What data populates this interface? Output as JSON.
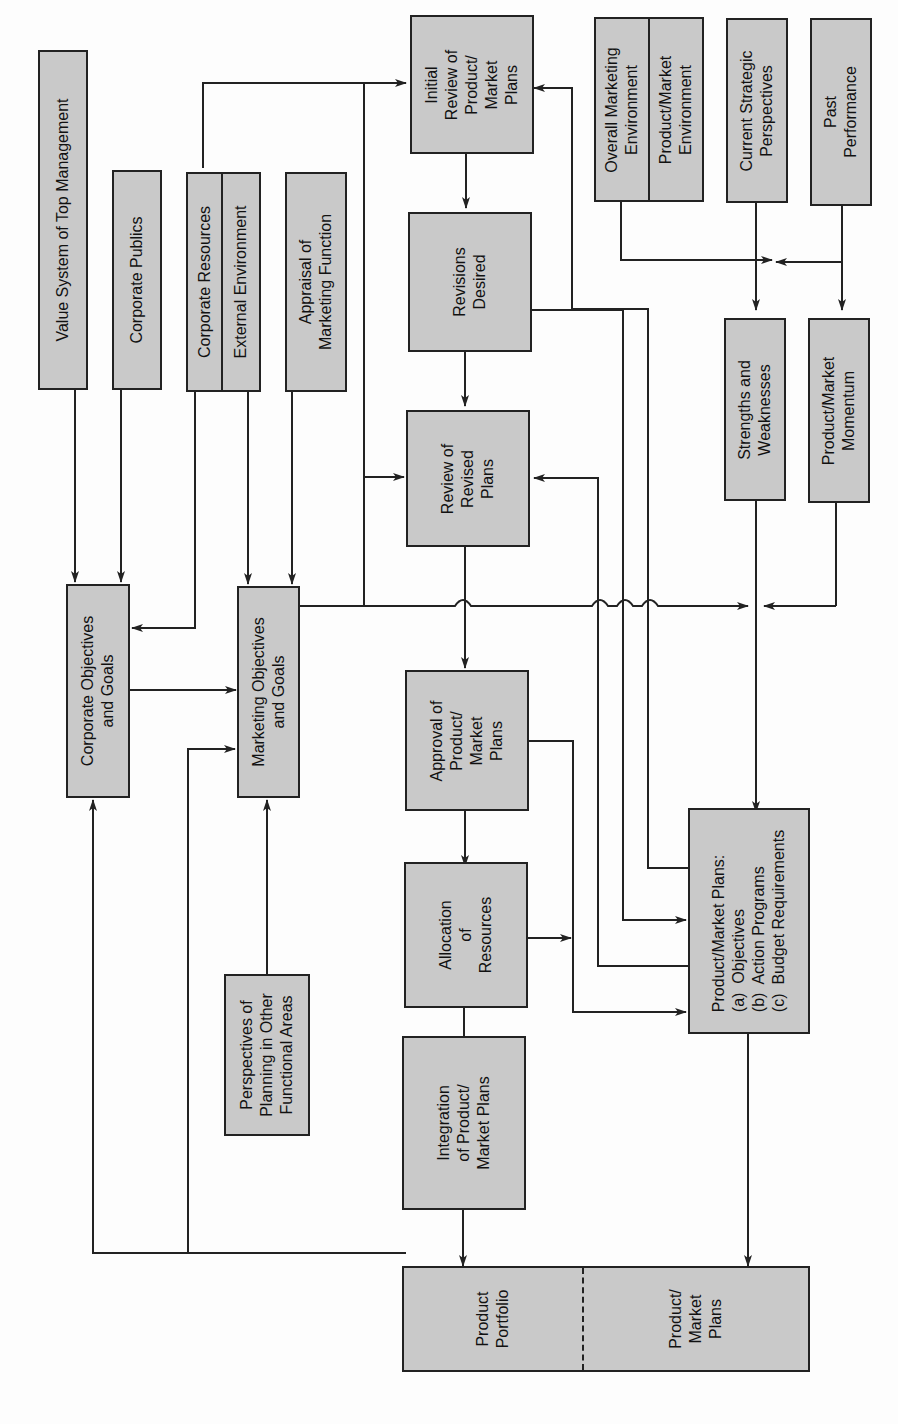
{
  "diagram": {
    "type": "flowchart",
    "orientation": "rotated-90-ccw",
    "colors": {
      "box_fill": "#c9c9c9",
      "stroke": "#222222",
      "background": "#fdfdfd"
    },
    "nodes": {
      "value_system": "Value System of Top Management",
      "corporate_publics": "Corporate Publics",
      "corporate_resources": "Corporate Resources",
      "external_environment": "External Environment",
      "appraisal_marketing": "Appraisal of\nMarketing Function",
      "initial_review": "Initial\nReview of\nProduct/\nMarket\nPlans",
      "overall_marketing_env": "Overall Marketing\nEnvironment",
      "product_market_env": "Product/Market\nEnvironment",
      "current_strategic": "Current Strategic\nPerspectives",
      "past_performance": "Past\nPerformance",
      "revisions_desired": "Revisions\nDesired",
      "strengths_weaknesses": "Strengths and\nWeaknesses",
      "product_market_momentum": "Product/Market\nMomentum",
      "review_revised": "Review of\nRevised\nPlans",
      "corporate_objectives": "Corporate Objectives\nand Goals",
      "marketing_objectives": "Marketing Objectives\nand Goals",
      "approval": "Approval of\nProduct/\nMarket\nPlans",
      "allocation": "Allocation\nof\nResources",
      "perspectives_other": "Perspectives of\nPlanning in Other\nFunctional Areas",
      "integration": "Integration\nof Product/\nMarket Plans",
      "product_market_plans": "Product/Market Plans:\n(a)  Objectives\n(b)  Action Programs\n(c)  Budget Requirements",
      "product_portfolio": "Product\nPortfolio",
      "portfolio_plans": "Product/\nMarket\nPlans"
    },
    "edges": [
      [
        "value_system",
        "corporate_objectives"
      ],
      [
        "corporate_publics",
        "corporate_objectives"
      ],
      [
        "corporate_resources",
        "corporate_objectives"
      ],
      [
        "corporate_resources",
        "initial_review"
      ],
      [
        "external_environment",
        "marketing_objectives"
      ],
      [
        "appraisal_marketing",
        "marketing_objectives"
      ],
      [
        "corporate_objectives",
        "marketing_objectives"
      ],
      [
        "perspectives_other",
        "marketing_objectives"
      ],
      [
        "marketing_objectives",
        "initial_review"
      ],
      [
        "marketing_objectives",
        "review_revised"
      ],
      [
        "marketing_objectives",
        "product_market_plans"
      ],
      [
        "initial_review",
        "revisions_desired"
      ],
      [
        "revisions_desired",
        "review_revised"
      ],
      [
        "revisions_desired",
        "product_market_plans"
      ],
      [
        "review_revised",
        "approval"
      ],
      [
        "approval",
        "allocation"
      ],
      [
        "approval",
        "product_market_plans"
      ],
      [
        "allocation",
        "integration"
      ],
      [
        "allocation",
        "product_market_plans"
      ],
      [
        "integration",
        "product_portfolio"
      ],
      [
        "product_market_plans",
        "initial_review"
      ],
      [
        "product_market_plans",
        "review_revised"
      ],
      [
        "product_market_plans",
        "portfolio_plans"
      ],
      [
        "product_portfolio",
        "corporate_objectives"
      ],
      [
        "product_portfolio",
        "marketing_objectives"
      ],
      [
        "overall_marketing_env",
        "strengths_weaknesses"
      ],
      [
        "current_strategic",
        "strengths_weaknesses"
      ],
      [
        "past_performance",
        "strengths_weaknesses"
      ],
      [
        "past_performance",
        "product_market_momentum"
      ],
      [
        "product_market_momentum",
        "product_market_plans"
      ],
      [
        "strengths_weaknesses",
        "product_market_plans"
      ]
    ]
  }
}
